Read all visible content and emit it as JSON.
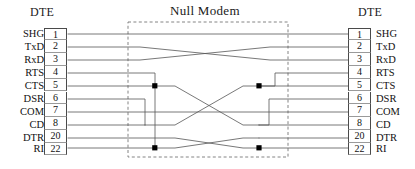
{
  "diagram": {
    "title": "Null Modem",
    "left_header": "DTE",
    "right_header": "DTE",
    "colors": {
      "wire": "#555555",
      "box_border": "#4a4a4a",
      "dashed_border": "#777777",
      "text": "#111111",
      "junction_dot": "#000000"
    },
    "left_pins": [
      {
        "signal": "SHG",
        "pin": "1"
      },
      {
        "signal": "TxD",
        "pin": "2"
      },
      {
        "signal": "RxD",
        "pin": "3"
      },
      {
        "signal": "RTS",
        "pin": "4"
      },
      {
        "signal": "CTS",
        "pin": "5"
      },
      {
        "signal": "DSR",
        "pin": "6"
      },
      {
        "signal": "COM",
        "pin": "7"
      },
      {
        "signal": "CD",
        "pin": "8"
      },
      {
        "signal": "DTR",
        "pin": "20"
      },
      {
        "signal": "RI",
        "pin": "22"
      }
    ],
    "right_pins": [
      {
        "signal": "SHG",
        "pin": "1"
      },
      {
        "signal": "TxD",
        "pin": "2"
      },
      {
        "signal": "RxD",
        "pin": "3"
      },
      {
        "signal": "RTS",
        "pin": "4"
      },
      {
        "signal": "CTS",
        "pin": "5"
      },
      {
        "signal": "DSR",
        "pin": "6"
      },
      {
        "signal": "COM",
        "pin": "7"
      },
      {
        "signal": "CD",
        "pin": "8"
      },
      {
        "signal": "DTR",
        "pin": "20"
      },
      {
        "signal": "RI",
        "pin": "22"
      }
    ],
    "connections": [
      {
        "from": "1",
        "to": "1",
        "label": "SHG to SHG"
      },
      {
        "from": "2",
        "to": "3",
        "label": "TxD to RxD"
      },
      {
        "from": "3",
        "to": "2",
        "label": "RxD to TxD"
      },
      {
        "from": "4+5",
        "to": "6+8",
        "label": "RTS/CTS to DSR/CD"
      },
      {
        "from": "6+8",
        "to": "4+5",
        "label": "DSR/CD to RTS/CTS"
      },
      {
        "from": "7",
        "to": "7",
        "label": "COM to COM"
      },
      {
        "from": "20",
        "to": "22",
        "label": "DTR to RI"
      },
      {
        "from": "22",
        "to": "20",
        "label": "RI to DTR"
      }
    ],
    "junction_dots": [
      {
        "x": 155,
        "y": 86,
        "label": "left-rts-cts-junction"
      },
      {
        "x": 155,
        "y": 148,
        "label": "left-dtr-ri-junction"
      },
      {
        "x": 259,
        "y": 86,
        "label": "right-rts-cts-junction"
      },
      {
        "x": 259,
        "y": 148,
        "label": "right-dtr-ri-junction"
      }
    ]
  }
}
